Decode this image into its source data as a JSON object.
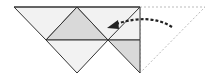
{
  "diagram": {
    "type": "origami-fold-step",
    "colors": {
      "background": "#ffffff",
      "paper_light": "#f2f2f2",
      "paper_shaded": "#d9d9d9",
      "edge": "#333333",
      "dashed_outline": "#bbbbbb",
      "arrow": "#222222"
    },
    "regions": [
      {
        "name": "left-outer-triangle",
        "points": [
          [
            14,
            7
          ],
          [
            77,
            7
          ],
          [
            46,
            40
          ]
        ],
        "fill": "paper_light"
      },
      {
        "name": "center-shaded-triangle",
        "points": [
          [
            77,
            7
          ],
          [
            108,
            40
          ],
          [
            46,
            40
          ]
        ],
        "fill": "paper_shaded"
      },
      {
        "name": "bottom-left-triangle",
        "points": [
          [
            46,
            40
          ],
          [
            108,
            40
          ],
          [
            77,
            73
          ]
        ],
        "fill": "paper_light"
      },
      {
        "name": "top-right-quad",
        "points": [
          [
            77,
            7
          ],
          [
            140,
            7
          ],
          [
            140,
            40
          ],
          [
            108,
            40
          ]
        ],
        "fill": "paper_light"
      },
      {
        "name": "bottom-right-shaded-triangle",
        "points": [
          [
            108,
            40
          ],
          [
            140,
            40
          ],
          [
            140,
            73
          ]
        ],
        "fill": "paper_shaded"
      }
    ],
    "dashed_flap": {
      "points": [
        [
          140,
          7
        ],
        [
          205,
          7
        ],
        [
          140,
          73
        ]
      ]
    },
    "arrow": {
      "from": [
        172,
        27
      ],
      "to": [
        108,
        27
      ],
      "style": "dashed-curved"
    }
  }
}
